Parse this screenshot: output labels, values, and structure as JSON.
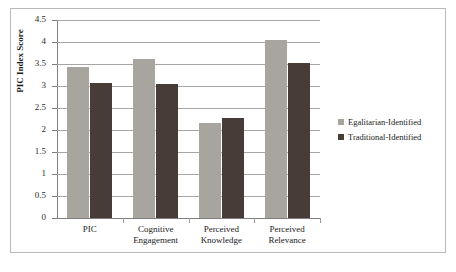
{
  "chart_data": {
    "type": "bar",
    "title": "",
    "xlabel": "",
    "ylabel": "PIC Index Score",
    "categories": [
      "PIC",
      "Cognitive\nEngagement",
      "Perceived\nKnowledge",
      "Perceived\nRelevance"
    ],
    "series": [
      {
        "name": "Egalitarian-Identified",
        "color": "#a8a49e",
        "values": [
          3.44,
          3.61,
          2.16,
          4.05
        ]
      },
      {
        "name": "Traditional-Identified",
        "color": "#473c38",
        "values": [
          3.07,
          3.05,
          2.28,
          3.53
        ]
      }
    ],
    "ylim": [
      0,
      4.5
    ],
    "yticks": [
      "0",
      "0.5",
      "1",
      "1.5",
      "2",
      "2.5",
      "3",
      "3.5",
      "4",
      "4.5"
    ],
    "ytick_values": [
      0,
      0.5,
      1,
      1.5,
      2,
      2.5,
      3,
      3.5,
      4,
      4.5
    ],
    "grid": true,
    "legend_position": "right"
  }
}
